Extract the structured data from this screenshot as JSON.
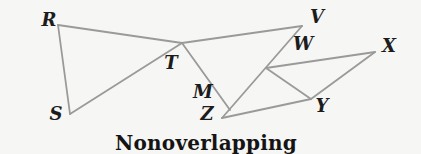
{
  "figure": {
    "caption": "Nonoverlapping",
    "canvas": {
      "width": 421,
      "height": 154
    },
    "colors": {
      "background": "#f6f6f4",
      "line": "#9a9a9a",
      "label": "#1c1c1c",
      "caption": "#141414"
    },
    "line_width": 1.8,
    "points": {
      "R": {
        "x": 58,
        "y": 25,
        "label": "R",
        "label_x": 49,
        "label_y": 20
      },
      "S": {
        "x": 70,
        "y": 114,
        "label": "S",
        "label_x": 56,
        "label_y": 114
      },
      "T": {
        "x": 182,
        "y": 43,
        "label": "T",
        "label_x": 171,
        "label_y": 63
      },
      "V": {
        "x": 302,
        "y": 26,
        "label": "V",
        "label_x": 317,
        "label_y": 17
      },
      "W": {
        "x": 266,
        "y": 68,
        "label": "W",
        "label_x": 303,
        "label_y": 44
      },
      "X": {
        "x": 375,
        "y": 52,
        "label": "X",
        "label_x": 389,
        "label_y": 46
      },
      "Y": {
        "x": 311,
        "y": 99,
        "label": "Y",
        "label_x": 322,
        "label_y": 106
      },
      "Z": {
        "x": 222,
        "y": 118,
        "label": "Z",
        "label_x": 207,
        "label_y": 114
      },
      "M": {
        "x": 230,
        "y": 110,
        "label": "M",
        "label_x": 203,
        "label_y": 92
      }
    },
    "edges": [
      [
        "R",
        "S"
      ],
      [
        "R",
        "T"
      ],
      [
        "S",
        "T"
      ],
      [
        "T",
        "V"
      ],
      [
        "T",
        "M"
      ],
      [
        "V",
        "Z"
      ],
      [
        "Z",
        "Y"
      ],
      [
        "W",
        "X"
      ],
      [
        "W",
        "Y"
      ],
      [
        "X",
        "Y"
      ]
    ],
    "caption_pos": {
      "x": 206,
      "y": 143
    }
  }
}
